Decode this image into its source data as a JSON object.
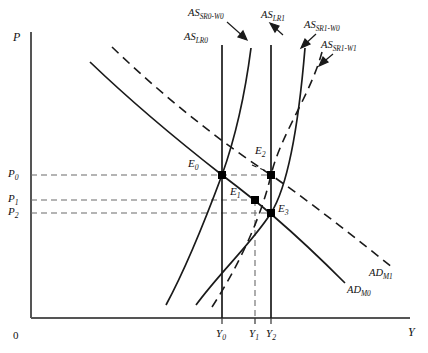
{
  "figure": {
    "type": "economics-diagram",
    "axes": {
      "y_label": "P",
      "x_label": "Y",
      "origin_label": "0"
    },
    "price_ticks": [
      {
        "id": "P0",
        "base": "P",
        "sub": "0",
        "y": 175
      },
      {
        "id": "P1",
        "base": "P",
        "sub": "1",
        "y": 200
      },
      {
        "id": "P2",
        "base": "P",
        "sub": "2",
        "y": 213
      }
    ],
    "output_ticks": [
      {
        "id": "Y0",
        "base": "Y",
        "sub": "0",
        "x": 222
      },
      {
        "id": "Y1",
        "base": "Y",
        "sub": "1",
        "x": 255
      },
      {
        "id": "Y2",
        "base": "Y",
        "sub": "2",
        "x": 271
      }
    ],
    "equilibria": [
      {
        "id": "E0",
        "base": "E",
        "sub": "0",
        "x": 222,
        "y": 175,
        "label_x": 188,
        "label_y": 163
      },
      {
        "id": "E1",
        "base": "E",
        "sub": "1",
        "x": 255,
        "y": 200,
        "label_x": 230,
        "label_y": 190
      },
      {
        "id": "E2",
        "base": "E",
        "sub": "2",
        "x": 271,
        "y": 175,
        "label_x": 256,
        "label_y": 148
      },
      {
        "id": "E3",
        "base": "E",
        "sub": "3",
        "x": 271,
        "y": 213,
        "label_x": 278,
        "label_y": 206
      }
    ],
    "curves": [
      {
        "id": "AS_LR0",
        "base": "AS",
        "sub": "LR0",
        "style": "solid",
        "kind": "vertical-long-run",
        "label_x": 186,
        "label_y": 34
      },
      {
        "id": "AS_SR0_W0",
        "base": "AS",
        "sub": "SR0-W0",
        "style": "solid",
        "kind": "short-run",
        "label_x": 189,
        "label_y": 12
      },
      {
        "id": "AS_LR1",
        "base": "AS",
        "sub": "LR1",
        "style": "solid",
        "kind": "vertical-long-run",
        "label_x": 262,
        "label_y": 14
      },
      {
        "id": "AS_SR1_W0",
        "base": "AS",
        "sub": "SR1-W0",
        "style": "solid",
        "kind": "short-run",
        "label_x": 305,
        "label_y": 24
      },
      {
        "id": "AS_SR1_W1",
        "base": "AS",
        "sub": "SR1-W1",
        "style": "dashed",
        "kind": "short-run",
        "label_x": 322,
        "label_y": 43
      },
      {
        "id": "AD_M0",
        "base": "AD",
        "sub": "M0",
        "style": "solid",
        "kind": "aggregate-demand",
        "label_x": 348,
        "label_y": 289
      },
      {
        "id": "AD_M1",
        "base": "AD",
        "sub": "M1",
        "style": "dashed",
        "kind": "aggregate-demand",
        "label_x": 370,
        "label_y": 272
      }
    ],
    "colors": {
      "line": "#1a1a1a",
      "axis": "#555555",
      "guide": "#6b6b6b",
      "background": "#ffffff"
    }
  }
}
